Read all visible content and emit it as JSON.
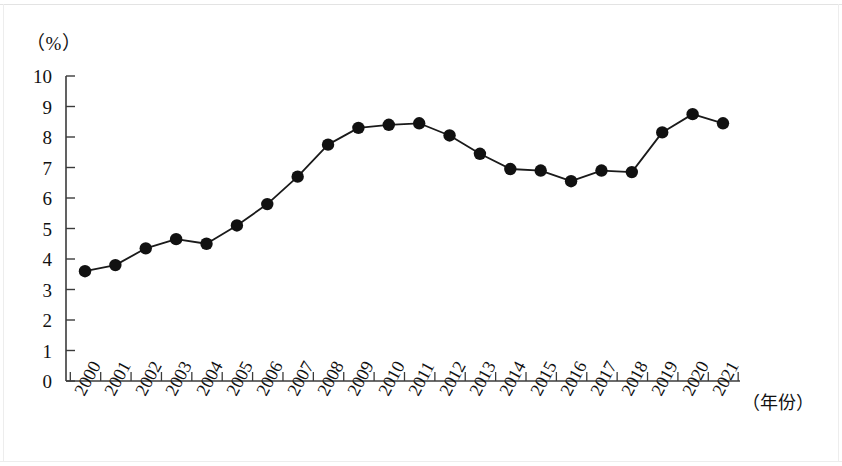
{
  "axis": {
    "unit_label": "（%）",
    "xaxis_title": "（年份）",
    "y_ticks": [
      "0",
      "1",
      "2",
      "3",
      "4",
      "5",
      "6",
      "7",
      "8",
      "9",
      "10"
    ]
  },
  "style": {
    "line_color": "#1a1a1a",
    "marker_color": "#111111",
    "axis_color": "#3b3b3b",
    "background": "#ffffff"
  },
  "chart_data": {
    "type": "line",
    "title": "",
    "subtitle": "",
    "xlabel": "（年份）",
    "ylabel": "（%）",
    "xlim": [
      2000,
      2021
    ],
    "ylim": [
      0,
      10
    ],
    "grid": false,
    "legend": null,
    "marker": "filled-circle",
    "categories": [
      "2000",
      "2001",
      "2002",
      "2003",
      "2004",
      "2005",
      "2006",
      "2007",
      "2008",
      "2009",
      "2010",
      "2011",
      "2012",
      "2013",
      "2014",
      "2015",
      "2016",
      "2017",
      "2018",
      "2019",
      "2020",
      "2021"
    ],
    "values": [
      3.6,
      3.8,
      4.35,
      4.65,
      4.5,
      5.1,
      5.8,
      6.7,
      7.75,
      8.3,
      8.4,
      8.45,
      8.05,
      7.45,
      6.95,
      6.9,
      6.55,
      6.9,
      6.85,
      8.15,
      8.75,
      8.45
    ],
    "y_tick_values": [
      0,
      1,
      2,
      3,
      4,
      5,
      6,
      7,
      8,
      9,
      10
    ],
    "x_tick_labels": [
      "2000",
      "2001",
      "2002",
      "2003",
      "2004",
      "2005",
      "2006",
      "2007",
      "2008",
      "2009",
      "2010",
      "2011",
      "2012",
      "2013",
      "2014",
      "2015",
      "2016",
      "2017",
      "2018",
      "2019",
      "2020",
      "2021"
    ]
  }
}
